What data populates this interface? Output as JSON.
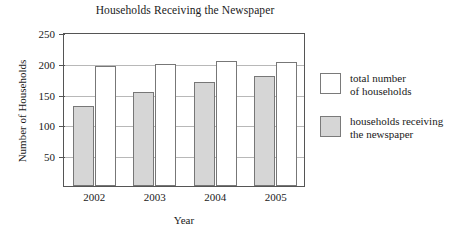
{
  "chart_data": {
    "type": "bar",
    "title": "Households Receiving the Newspaper",
    "xlabel": "Year",
    "ylabel": "Number of Households",
    "categories": [
      "2002",
      "2003",
      "2004",
      "2005"
    ],
    "series": [
      {
        "name": "households receiving\nthe newspaper",
        "values": [
          130,
          153,
          169,
          178
        ],
        "fill": "#d6d6d6"
      },
      {
        "name": "total number\nof households",
        "values": [
          195,
          198,
          203,
          202
        ],
        "fill": "#ffffff"
      }
    ],
    "ylim": [
      0,
      250
    ],
    "yticks": [
      50,
      100,
      150,
      200,
      250
    ],
    "grid": true,
    "legend_position": "right"
  },
  "legend": {
    "entries": [
      {
        "label": "total number\nof households",
        "swatch": "white-square"
      },
      {
        "label": "households receiving\nthe newspaper",
        "swatch": "gray-square"
      }
    ]
  },
  "colors": {
    "bar_fill_receiving": "#d6d6d6",
    "bar_fill_total": "#ffffff",
    "bar_stroke": "#777777",
    "axis": "#555555",
    "gridline": "#b8b8b8",
    "text": "#1a1a1a"
  }
}
